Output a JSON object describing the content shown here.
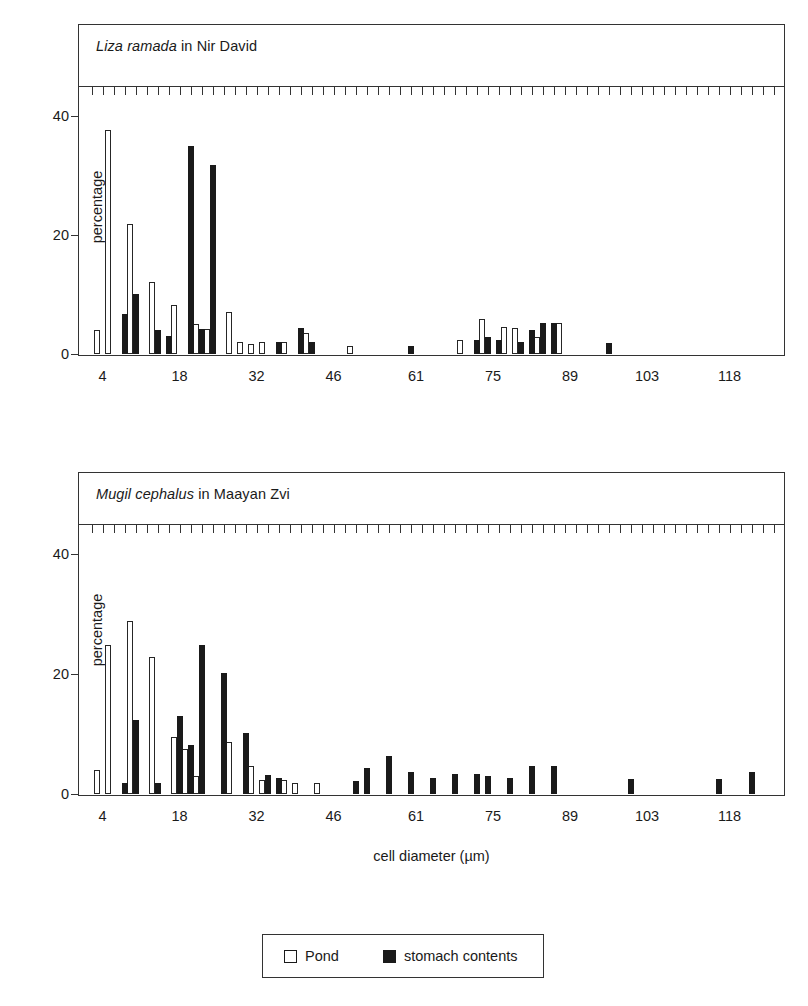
{
  "figure": {
    "xaxis_title": "cell diameter (µm)",
    "yaxis_label": "percentage"
  },
  "legend": {
    "pond_label": "Pond",
    "stomach_label": "stomach contents",
    "pond_color": "#ffffff",
    "stomach_color": "#1a1a1a",
    "outline_color": "#1a1a1a"
  },
  "panels": [
    {
      "title_italic": "Liza ramada",
      "title_rest": " in Nir David"
    },
    {
      "title_italic": "Mugil cephalus",
      "title_rest": " in Maayan Zvi"
    }
  ],
  "chart_data": [
    {
      "type": "bar",
      "title": "Liza ramada in Nir David",
      "xlabel": "cell diameter (µm)",
      "ylabel": "percentage",
      "ylim": [
        0,
        45
      ],
      "yticks": [
        0,
        20,
        40
      ],
      "xlim": [
        1,
        127
      ],
      "xticks": [
        4,
        18,
        32,
        46,
        61,
        75,
        89,
        103,
        118
      ],
      "xtick_step": 2,
      "grid": false,
      "legend_position": "bottom",
      "x": [
        3,
        5,
        7,
        9,
        11,
        13,
        15,
        17,
        19,
        21,
        23,
        25,
        27,
        29,
        31,
        33,
        35,
        37,
        39,
        41,
        43,
        45,
        47,
        49,
        51,
        53,
        55,
        57,
        59,
        61,
        63,
        65,
        67,
        69,
        71,
        73,
        75,
        77,
        79,
        81,
        83,
        85,
        87,
        89,
        91,
        93,
        95,
        97,
        99,
        101,
        103,
        105,
        107,
        109,
        111,
        113,
        115,
        117,
        119,
        121,
        123,
        125
      ],
      "series": [
        {
          "name": "Pond",
          "color": "#ffffff",
          "values": [
            4.0,
            37.6,
            0,
            21.9,
            0,
            12.1,
            0,
            8.2,
            0,
            5.0,
            4.2,
            0,
            7.0,
            2.1,
            1.6,
            2.0,
            0,
            2.0,
            0,
            3.6,
            0,
            0,
            0,
            1.3,
            0,
            0,
            0,
            0,
            0,
            0,
            0,
            0,
            0,
            2.3,
            0,
            5.9,
            0,
            4.6,
            4.4,
            0,
            2.8,
            0,
            5.2,
            0,
            0,
            0,
            0,
            0,
            0,
            0,
            0,
            0,
            0,
            0,
            0,
            0,
            0,
            0,
            0,
            0,
            0,
            0,
            0
          ]
        },
        {
          "name": "stomach contents",
          "color": "#1a1a1a",
          "values": [
            0,
            0,
            6.8,
            10.0,
            0,
            4.1,
            3.0,
            0,
            34.9,
            4.2,
            31.8,
            0,
            0,
            0,
            0,
            0,
            2.1,
            0,
            4.4,
            2.0,
            0,
            0,
            0,
            0,
            0,
            0,
            0,
            0,
            1.3,
            0,
            0,
            0,
            0,
            0,
            2.4,
            2.9,
            2.4,
            0,
            2.0,
            4.0,
            5.2,
            5.2,
            0,
            0,
            0,
            0,
            1.9,
            0,
            0,
            0,
            0,
            0,
            0,
            0,
            0,
            0,
            0,
            0,
            0,
            0,
            0,
            0
          ]
        }
      ]
    },
    {
      "type": "bar",
      "title": "Mugil cephalus in Maayan Zvi",
      "xlabel": "cell diameter (µm)",
      "ylabel": "percentage",
      "ylim": [
        0,
        45
      ],
      "yticks": [
        0,
        20,
        40
      ],
      "xlim": [
        1,
        127
      ],
      "xticks": [
        4,
        18,
        32,
        46,
        61,
        75,
        89,
        103,
        118
      ],
      "xtick_step": 2,
      "grid": false,
      "legend_position": "bottom",
      "x": [
        3,
        5,
        7,
        9,
        11,
        13,
        15,
        17,
        19,
        21,
        23,
        25,
        27,
        29,
        31,
        33,
        35,
        37,
        39,
        41,
        43,
        45,
        47,
        49,
        51,
        53,
        55,
        57,
        59,
        61,
        63,
        65,
        67,
        69,
        71,
        73,
        75,
        77,
        79,
        81,
        83,
        85,
        87,
        89,
        91,
        93,
        95,
        97,
        99,
        101,
        103,
        105,
        107,
        109,
        111,
        113,
        115,
        117,
        119,
        121,
        123,
        125
      ],
      "series": [
        {
          "name": "Pond",
          "color": "#ffffff",
          "values": [
            4.0,
            24.8,
            0,
            28.8,
            0,
            22.8,
            0,
            9.5,
            7.5,
            3.0,
            0,
            0,
            8.6,
            0,
            4.6,
            2.3,
            0,
            2.4,
            1.8,
            0,
            1.9,
            0,
            0,
            0,
            0,
            0,
            0,
            0,
            0,
            0,
            0,
            0,
            0,
            0,
            0,
            0,
            0,
            0,
            0,
            0,
            0,
            0,
            0,
            0,
            0,
            0,
            0,
            0,
            0,
            0,
            0,
            0,
            0,
            0,
            0,
            0,
            0,
            0,
            0,
            0,
            0,
            0
          ]
        },
        {
          "name": "stomach contents",
          "color": "#1a1a1a",
          "values": [
            0,
            0,
            1.9,
            12.3,
            0,
            1.9,
            0,
            13.0,
            8.2,
            24.9,
            0,
            20.1,
            0,
            10.2,
            0,
            3.1,
            2.6,
            0,
            0,
            0,
            0,
            0,
            0,
            2.1,
            4.4,
            0,
            6.4,
            0,
            3.6,
            0,
            2.7,
            0,
            3.3,
            0,
            3.4,
            3.0,
            0,
            2.6,
            0,
            4.7,
            0,
            4.7,
            0,
            0,
            0,
            0,
            0,
            0,
            2.5,
            0,
            0,
            0,
            0,
            0,
            0,
            0,
            2.5,
            0,
            0,
            3.6,
            0,
            0
          ]
        }
      ]
    }
  ]
}
